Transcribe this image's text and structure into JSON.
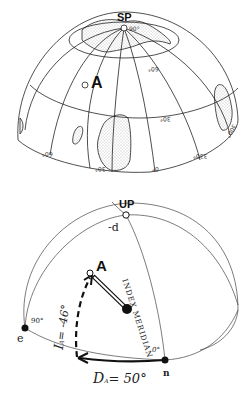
{
  "top_globe": {
    "pole_label": "SP",
    "pole_value": "90°",
    "site_label": "A",
    "latitude_labels": [
      "60°",
      "30°"
    ],
    "longitude_labels": [
      "60°",
      "30°",
      "0°",
      "330°",
      "300°"
    ]
  },
  "bottom_sphere": {
    "pole_label": "UP",
    "pole_sublabel": "-d",
    "site_label": "A",
    "meridian_label": "INDEX MERIDIAN",
    "east_label": "e",
    "east_angle": "90°",
    "north_label": "n",
    "north_angle": "0°",
    "inclination_label": "I",
    "inclination_sub": "A",
    "inclination_value": "= -46°",
    "declination_label": "D",
    "declination_sub": "A",
    "declination_value": "= 50°"
  }
}
